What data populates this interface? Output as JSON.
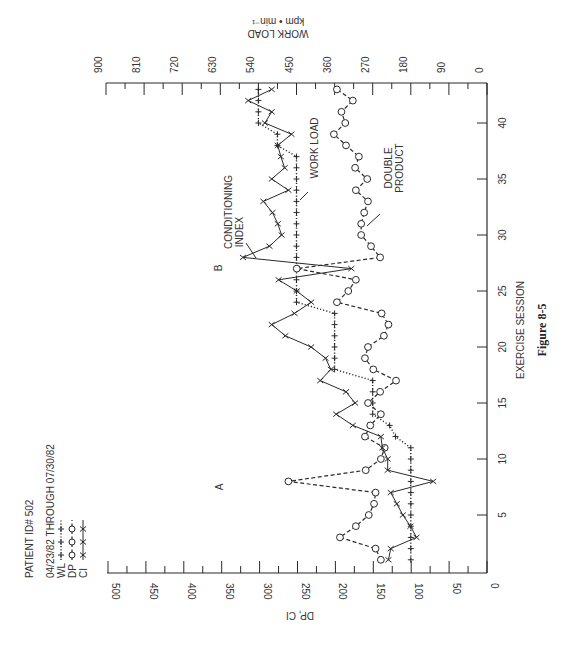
{
  "figure": {
    "caption": "Figure 8-5",
    "annotations": {
      "A": "A",
      "B": "B"
    },
    "series_labels": {
      "ci": [
        "CONDITIONING",
        "INDEX"
      ],
      "wl": "WORK LOAD",
      "dp": [
        "DOUBLE",
        "PRODUCT"
      ]
    }
  },
  "legend": {
    "patient": "PATIENT ID# 502",
    "dates": "04/23/82 THROUGH 07/30/82",
    "entries": [
      {
        "key": "WL",
        "sample": "-+-+-+-+"
      },
      {
        "key": "DP",
        "sample": "-O-O-O-"
      },
      {
        "key": "CI",
        "sample": "-X-X-X"
      }
    ]
  },
  "chart_data": {
    "type": "line",
    "orientation": "rotated 90° counter-clockwise (session axis vertical, increasing upward)",
    "title": "",
    "xlabel": "EXERCISE SESSION",
    "ylabel": "DP, CI",
    "y2label": "WORK LOAD kpm • min⁻¹",
    "xlim": [
      0,
      44
    ],
    "ylim": [
      0,
      500
    ],
    "y2lim": [
      0,
      900
    ],
    "x_ticks": [
      5,
      10,
      15,
      20,
      25,
      30,
      35,
      40
    ],
    "y_ticks": [
      0,
      50,
      100,
      150,
      200,
      250,
      300,
      350,
      400,
      450,
      500
    ],
    "y2_ticks": [
      0,
      90,
      180,
      270,
      360,
      450,
      540,
      630,
      720,
      810,
      900
    ],
    "grid": false,
    "x": [
      1,
      2,
      3,
      4,
      5,
      6,
      7,
      8,
      9,
      10,
      11,
      12,
      13,
      14,
      15,
      16,
      17,
      18,
      19,
      20,
      21,
      22,
      23,
      24,
      25,
      26,
      27,
      28,
      29,
      30,
      31,
      32,
      33,
      34,
      35,
      36,
      37,
      38,
      39,
      40,
      41,
      42,
      43
    ],
    "series": [
      {
        "name": "WL",
        "axis": "right",
        "marker": "+",
        "style": "dotted",
        "values": [
          180,
          180,
          180,
          180,
          180,
          180,
          180,
          180,
          180,
          180,
          180,
          216,
          230,
          270,
          270,
          270,
          270,
          360,
          360,
          360,
          360,
          360,
          360,
          450,
          450,
          450,
          450,
          450,
          450,
          450,
          450,
          450,
          450,
          450,
          450,
          450,
          450,
          495,
          495,
          540,
          540,
          540,
          540
        ]
      },
      {
        "name": "DP",
        "axis": "left",
        "marker": "o",
        "style": "dashed",
        "values": [
          140,
          147,
          194,
          173,
          156,
          149,
          147,
          262,
          160,
          140,
          135,
          161,
          154,
          140,
          157,
          141,
          120,
          150,
          161,
          157,
          136,
          130,
          139,
          198,
          183,
          173,
          251,
          141,
          153,
          166,
          166,
          162,
          157,
          173,
          158,
          174,
          169,
          186,
          202,
          187,
          192,
          177,
          198
        ]
      },
      {
        "name": "CI",
        "axis": "left",
        "marker": "x",
        "style": "solid",
        "values": [
          130,
          127,
          93,
          101,
          111,
          119,
          127,
          71,
          131,
          131,
          138,
          140,
          177,
          199,
          174,
          186,
          220,
          206,
          213,
          232,
          266,
          284,
          254,
          232,
          251,
          275,
          179,
          322,
          287,
          271,
          276,
          283,
          295,
          262,
          284,
          267,
          272,
          276,
          258,
          293,
          284,
          315,
          284
        ]
      }
    ],
    "annotations": [
      {
        "text": "A",
        "session": 8,
        "value": 350
      },
      {
        "text": "B",
        "session": 27,
        "value": 350
      },
      {
        "text": "CONDITIONING INDEX",
        "points_to": "CI",
        "session": 28
      },
      {
        "text": "WORK LOAD",
        "points_to": "WL",
        "session": 33
      },
      {
        "text": "DOUBLE PRODUCT",
        "points_to": "DP",
        "session": 30
      }
    ],
    "legend_position": "left (rotated)"
  }
}
